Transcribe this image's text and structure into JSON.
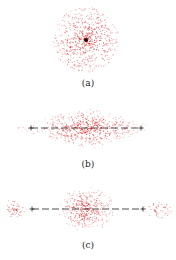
{
  "figure": {
    "panels": [
      {
        "id": "a",
        "label": "(a)",
        "center": [
          86,
          40
        ],
        "shape": "radial",
        "label_y": 79
      },
      {
        "id": "b",
        "label": "(b)",
        "center": [
          86,
          128
        ],
        "shape": "elongated",
        "label_y": 160
      },
      {
        "id": "c",
        "label": "(c)",
        "center": [
          86,
          209
        ],
        "shape": "split",
        "label_y": 241
      }
    ],
    "colors": {
      "points": "#e03030",
      "line": "#222222",
      "center_dot": "#300000"
    }
  },
  "chart_data": [
    {
      "type": "scatter",
      "title": "(a)",
      "description": "Isotropic radial point cloud, dense center with dark core",
      "center": [
        86,
        40
      ],
      "radius": 33,
      "n_points": 600,
      "series": [
        {
          "name": "points",
          "color": "#e03030"
        }
      ]
    },
    {
      "type": "scatter",
      "title": "(b)",
      "description": "Horizontally elongated diamond-shaped point cloud with dashed axis line and '+' endpoint markers",
      "center": [
        86,
        128
      ],
      "half_width": 72,
      "half_height": 22,
      "n_points": 550,
      "line": {
        "y": 128,
        "x_start": 31,
        "x_end": 141,
        "style": "dashed",
        "endpoint_markers": "+"
      },
      "series": [
        {
          "name": "points",
          "color": "#e03030"
        }
      ]
    },
    {
      "type": "scatter",
      "title": "(c)",
      "description": "Central point cloud plus two separated side clusters, dashed axis line with '+' markers between",
      "center": [
        86,
        209
      ],
      "clusters": [
        {
          "cx": 86,
          "cy": 209,
          "rx": 28,
          "ry": 22,
          "n": 380
        },
        {
          "cx": 14,
          "cy": 209,
          "rx": 13,
          "ry": 10,
          "n": 50
        },
        {
          "cx": 158,
          "cy": 209,
          "rx": 14,
          "ry": 10,
          "n": 50
        }
      ],
      "line": {
        "y": 209,
        "x_start": 32,
        "x_end": 143,
        "style": "dashed",
        "endpoint_markers": "+"
      },
      "series": [
        {
          "name": "points",
          "color": "#e03030"
        }
      ]
    }
  ]
}
